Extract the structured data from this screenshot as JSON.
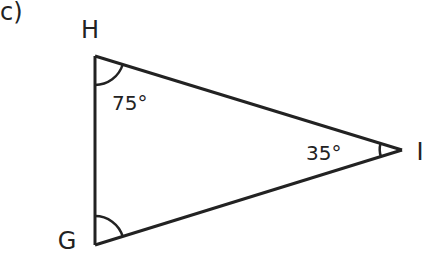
{
  "question_label": "c)",
  "triangle": {
    "vertices": [
      {
        "name": "H",
        "x": 95,
        "y": 56,
        "label_x": 90,
        "label_y": 38
      },
      {
        "name": "G",
        "x": 95,
        "y": 245,
        "label_x": 67,
        "label_y": 249
      },
      {
        "name": "I",
        "x": 402,
        "y": 150,
        "label_x": 420,
        "label_y": 160
      }
    ],
    "angles": [
      {
        "vertex": "H",
        "value": "75°",
        "label_x": 112,
        "label_y": 110
      },
      {
        "vertex": "I",
        "value": "35°",
        "label_x": 305,
        "label_y": 160
      },
      {
        "vertex": "G",
        "value": "",
        "label_x": 0,
        "label_y": 0
      }
    ]
  },
  "colors": {
    "stroke": "#222222",
    "background": "#ffffff"
  }
}
